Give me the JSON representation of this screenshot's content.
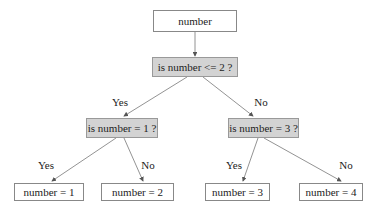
{
  "diagram": {
    "type": "decision-tree",
    "colors": {
      "decision_fill": "#d3d3d3",
      "leaf_fill": "#ffffff",
      "stroke": "#888888"
    },
    "nodes": {
      "root": {
        "label": "number"
      },
      "d1": {
        "label": "is number <= 2 ?"
      },
      "d2": {
        "label": "is number = 1 ?"
      },
      "d3": {
        "label": "is number = 3 ?"
      },
      "l1": {
        "label": "number = 1"
      },
      "l2": {
        "label": "number = 2"
      },
      "l3": {
        "label": "number = 3"
      },
      "l4": {
        "label": "number = 4"
      }
    },
    "edges": [
      {
        "from": "root",
        "to": "d1",
        "label": ""
      },
      {
        "from": "d1",
        "to": "d2",
        "label": "Yes"
      },
      {
        "from": "d1",
        "to": "d3",
        "label": "No"
      },
      {
        "from": "d2",
        "to": "l1",
        "label": "Yes"
      },
      {
        "from": "d2",
        "to": "l2",
        "label": "No"
      },
      {
        "from": "d3",
        "to": "l3",
        "label": "Yes"
      },
      {
        "from": "d3",
        "to": "l4",
        "label": "No"
      }
    ]
  }
}
